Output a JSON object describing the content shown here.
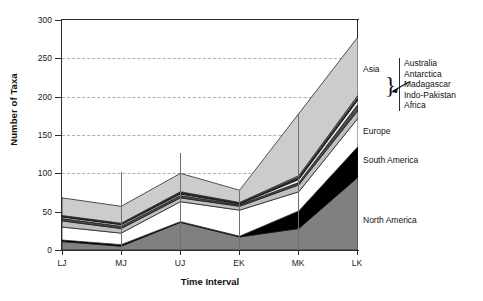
{
  "chart_data": {
    "type": "area",
    "stacked": true,
    "title": "",
    "xlabel": "Time Interval",
    "ylabel": "Number of Taxa",
    "categories": [
      "LJ",
      "MJ",
      "UJ",
      "EK",
      "MK",
      "LK"
    ],
    "x_tick_labels": [
      "LJ",
      "MJ",
      "UJ",
      "EK",
      "MK",
      "LK"
    ],
    "y_tick_labels": [
      "0",
      "50",
      "100",
      "150",
      "200",
      "250",
      "300"
    ],
    "y_ticks": [
      0,
      50,
      100,
      150,
      200,
      250,
      300
    ],
    "ylim": [
      0,
      300
    ],
    "grid": "horizontal-dashed",
    "legend_position": "right-inline",
    "series": [
      {
        "name": "North America",
        "color": "#808080",
        "values": [
          11,
          5,
          36,
          17,
          28,
          95
        ]
      },
      {
        "name": "South America",
        "color": "#000000",
        "values": [
          13,
          7,
          37,
          18,
          51,
          135
        ]
      },
      {
        "name": "Europe",
        "color": "#ffffff",
        "values": [
          30,
          22,
          63,
          52,
          76,
          172
        ]
      },
      {
        "name": "Africa",
        "color": "#bfbfbf",
        "values": [
          38,
          28,
          68,
          57,
          85,
          182
        ]
      },
      {
        "name": "Indo-Pakistan",
        "color": "#4d4d4d",
        "values": [
          41,
          31,
          71,
          59,
          88,
          190
        ]
      },
      {
        "name": "Madagascar",
        "color": "#e8e8e8",
        "values": [
          43,
          33,
          73,
          60,
          92,
          196
        ]
      },
      {
        "name": "Antarctica",
        "color": "#2b2b2b",
        "values": [
          44,
          34,
          75,
          61,
          95,
          199
        ]
      },
      {
        "name": "Australia",
        "color": "#9e9e9e",
        "values": [
          45,
          35,
          76,
          62,
          97,
          202
        ]
      },
      {
        "name": "Asia",
        "color": "#cccccc",
        "values": [
          68,
          57,
          100,
          78,
          178,
          278
        ]
      }
    ],
    "annotations": {
      "asia_label": "Asia",
      "europe_label": "Europe",
      "south_america_label": "South America",
      "north_america_label": "North America",
      "grouped_labels": [
        "Australia",
        "Antarctica",
        "Madagascar",
        "Indo-Pakistan",
        "Africa"
      ],
      "brace_glyph": "}"
    }
  },
  "axes": {
    "y_title": "Number of Taxa",
    "x_title": "Time Interval"
  }
}
